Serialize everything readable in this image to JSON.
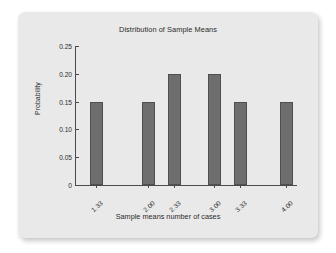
{
  "chart_data": {
    "type": "bar",
    "title": "Distribution of Sample Means",
    "xlabel": "Sample means number of cases",
    "ylabel": "Probability",
    "categories": [
      "1.33",
      "2.00",
      "2.33",
      "3.00",
      "3.33",
      "4.00"
    ],
    "values": [
      0.15,
      0.15,
      0.2,
      0.2,
      0.15,
      0.15
    ],
    "ylim": [
      0,
      0.25
    ],
    "yticks": [
      "0",
      "0.05",
      "0.10",
      "0.15",
      "0.20",
      "0.25"
    ],
    "ytick_values": [
      0,
      0.05,
      0.1,
      0.15,
      0.2,
      0.25
    ],
    "grid": false,
    "legend": "none",
    "bar_color": "#6e6e6e",
    "bar_edge_color": "#4f4f4f",
    "plot_background": "#e9e9e9",
    "axis_color": "#4a4a4a",
    "text_color": "#2b2b2b"
  }
}
